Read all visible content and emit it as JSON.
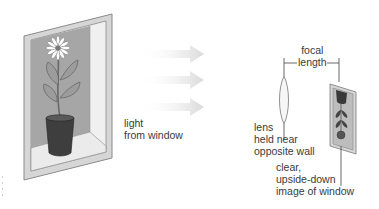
{
  "labels": {
    "light": [
      "light",
      "from window"
    ],
    "focal": [
      "focal",
      "length"
    ],
    "lens": [
      "lens",
      "held near",
      "opposite wall"
    ],
    "image": [
      "clear,",
      "upside-down",
      "image of window"
    ]
  },
  "colors": {
    "frame": "#d4d4d4",
    "frame_edge": "#8a8a8a",
    "window_glass": "#a9a9a9",
    "sill": "#ececec",
    "pot": "#3e3e3e",
    "leaf": "#9a9a9a",
    "arrow": "#e2e2e2",
    "lens": "#f4f4f4",
    "text": "#3a3a3a"
  }
}
